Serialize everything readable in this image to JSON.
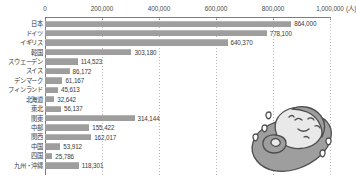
{
  "chart_data": {
    "type": "bar",
    "orientation": "horizontal",
    "title": "",
    "xlabel": "",
    "ylabel": "",
    "unit_label": "(人)",
    "xlim": [
      0,
      1000000
    ],
    "grid": true,
    "legend": "none",
    "axis_ticks": [
      "0",
      "200,000",
      "400,000",
      "600,000",
      "800,000",
      "1,000,000"
    ],
    "axis_tick_values": [
      0,
      200000,
      400000,
      600000,
      800000,
      1000000
    ],
    "categories": [
      "日本",
      "ドイツ",
      "イギリス",
      "韓国",
      "スウェーデン",
      "スイス",
      "デンマーク",
      "フィンランド",
      "北海道",
      "東北",
      "関東",
      "中部",
      "関西",
      "中国",
      "四国",
      "九州・沖縄"
    ],
    "values": [
      864000,
      778100,
      640370,
      303180,
      114523,
      86172,
      61167,
      45613,
      32642,
      56137,
      314144,
      155422,
      162017,
      53912,
      25786,
      118301
    ],
    "value_labels": [
      "864,000",
      "778,100",
      "640,370",
      "303,180",
      "114,523",
      "86,172",
      "61,167",
      "45,613",
      "32,642",
      "56,137",
      "314,144",
      "155,422",
      "162,017",
      "53,912",
      "25,786",
      "118,301"
    ],
    "bar_color": "#9e9e9e",
    "axis_color": "#7d7d7d",
    "grid_color": "#b9b9b9",
    "text_color": "#3a3a3a"
  },
  "illustration": {
    "name": "sweating-bean-character",
    "description": "cartoon character in a pod with sweat drops",
    "body_color": "#9e9e9e",
    "face_color": "#e8e8e8",
    "outline_color": "#4a4a4a"
  }
}
